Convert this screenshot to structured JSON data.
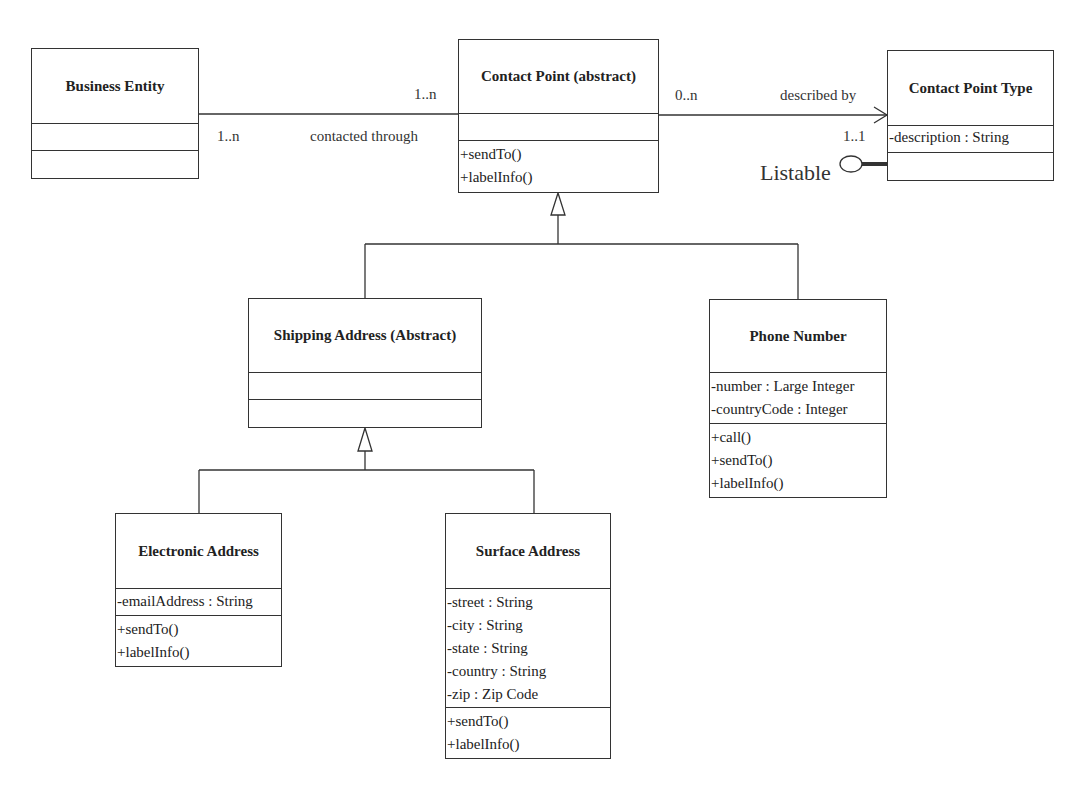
{
  "diagram": {
    "type": "UML class diagram",
    "classes": {
      "business_entity": {
        "name": "Business Entity",
        "attributes": [],
        "operations": []
      },
      "contact_point": {
        "name": "Contact Point (abstract)",
        "attributes": [],
        "operations": [
          "+sendTo()",
          "+labelInfo()"
        ]
      },
      "contact_point_type": {
        "name": "Contact Point Type",
        "attributes": [
          "-description : String"
        ],
        "operations": []
      },
      "shipping_address": {
        "name": "Shipping Address (Abstract)",
        "attributes": [],
        "operations": []
      },
      "phone_number": {
        "name": "Phone Number",
        "attributes": [
          "-number : Large Integer",
          "-countryCode : Integer"
        ],
        "operations": [
          "+call()",
          "+sendTo()",
          "+labelInfo()"
        ]
      },
      "electronic_address": {
        "name": "Electronic Address",
        "attributes": [
          "-emailAddress : String"
        ],
        "operations": [
          "+sendTo()",
          "+labelInfo()"
        ]
      },
      "surface_address": {
        "name": "Surface Address",
        "attributes": [
          "-street : String",
          "-city : String",
          "-state : String",
          "-country : String",
          "-zip : Zip Code"
        ],
        "operations": [
          "+sendTo()",
          "+labelInfo()"
        ]
      }
    },
    "associations": {
      "contacted_through": {
        "label": "contacted through",
        "from_multiplicity": "1..n",
        "to_multiplicity": "1..n"
      },
      "described_by": {
        "label": "described by",
        "from_multiplicity": "0..n",
        "to_multiplicity": "1..1"
      }
    },
    "interface": {
      "name": "Listable"
    },
    "generalizations": [
      {
        "parent": "Contact Point (abstract)",
        "children": [
          "Shipping Address (Abstract)",
          "Phone Number"
        ]
      },
      {
        "parent": "Shipping Address (Abstract)",
        "children": [
          "Electronic Address",
          "Surface Address"
        ]
      }
    ]
  }
}
